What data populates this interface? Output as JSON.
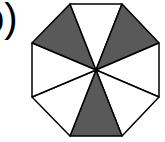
{
  "label": "b)",
  "figure": {
    "shape": "regular octagon",
    "total_sections": 8,
    "shaded_sections": 3,
    "shaded_indices": [
      0,
      2,
      5
    ],
    "fill_shaded": "#595959",
    "fill_unshaded": "#ffffff",
    "stroke": "#000000",
    "center": [
      96,
      70
    ],
    "vertices": [
      [
        70,
        4
      ],
      [
        122,
        4
      ],
      [
        159,
        43
      ],
      [
        159,
        97
      ],
      [
        122,
        136
      ],
      [
        70,
        136
      ],
      [
        32,
        97
      ],
      [
        32,
        43
      ]
    ]
  }
}
